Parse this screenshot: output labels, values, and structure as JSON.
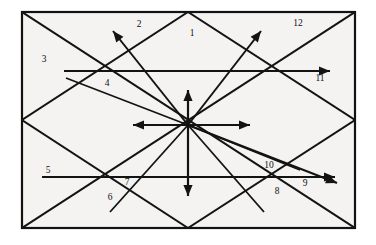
{
  "figure": {
    "kind": "geometric-line-diagram",
    "canvas": {
      "width": 376,
      "height": 245
    },
    "colors": {
      "ink": "#131313",
      "paper": "#f4f3f1",
      "page": "#ffffff"
    },
    "frame": {
      "name": "outer-rectangle",
      "x": 22,
      "y": 12,
      "width": 333,
      "height": 216
    },
    "center": {
      "x": 188,
      "y": 125
    },
    "labels": [
      {
        "id": "1",
        "text": "1",
        "x": 192,
        "y": 36
      },
      {
        "id": "2",
        "text": "2",
        "x": 139,
        "y": 27
      },
      {
        "id": "3",
        "text": "3",
        "x": 44,
        "y": 62
      },
      {
        "id": "4",
        "text": "4",
        "x": 107,
        "y": 86
      },
      {
        "id": "5",
        "text": "5",
        "x": 48,
        "y": 173
      },
      {
        "id": "6",
        "text": "6",
        "x": 110,
        "y": 200
      },
      {
        "id": "7",
        "text": "7",
        "x": 127,
        "y": 185
      },
      {
        "id": "8",
        "text": "8",
        "x": 277,
        "y": 194
      },
      {
        "id": "9",
        "text": "9",
        "x": 305,
        "y": 186
      },
      {
        "id": "10",
        "text": "10",
        "x": 269,
        "y": 168
      },
      {
        "id": "11",
        "text": "11",
        "x": 320,
        "y": 81
      },
      {
        "id": "12",
        "text": "12",
        "x": 298,
        "y": 26
      }
    ],
    "segments": [
      {
        "name": "diagonal-topleft-to-bottomright",
        "x1": 22,
        "y1": 12,
        "x2": 355,
        "y2": 228
      },
      {
        "name": "diagonal-bottomleft-to-topright",
        "x1": 22,
        "y1": 228,
        "x2": 355,
        "y2": 12
      },
      {
        "name": "rhombus-upper-left-edge",
        "x1": 22,
        "y1": 120,
        "x2": 188,
        "y2": 12
      },
      {
        "name": "rhombus-upper-right-edge",
        "x1": 188,
        "y1": 12,
        "x2": 355,
        "y2": 120
      },
      {
        "name": "rhombus-lower-right-edge",
        "x1": 355,
        "y1": 120,
        "x2": 188,
        "y2": 228
      },
      {
        "name": "rhombus-lower-left-edge",
        "x1": 188,
        "y1": 228,
        "x2": 22,
        "y2": 120
      }
    ],
    "arrows": [
      {
        "name": "ray-up",
        "x1": 188,
        "y1": 125,
        "x2": 188,
        "y2": 90,
        "head": true
      },
      {
        "name": "ray-down",
        "x1": 188,
        "y1": 125,
        "x2": 188,
        "y2": 196,
        "head": true
      },
      {
        "name": "ray-left",
        "x1": 188,
        "y1": 125,
        "x2": 133,
        "y2": 125,
        "head": true
      },
      {
        "name": "ray-right",
        "x1": 188,
        "y1": 125,
        "x2": 250,
        "y2": 125,
        "head": true
      },
      {
        "name": "ray-upper-left-diagonal",
        "x1": 188,
        "y1": 125,
        "x2": 113,
        "y2": 31,
        "head": true
      },
      {
        "name": "ray-upper-right-diagonal",
        "x1": 188,
        "y1": 125,
        "x2": 261,
        "y2": 31,
        "head": true
      },
      {
        "name": "horizontal-line-upper",
        "x1": 64,
        "y1": 71,
        "x2": 330,
        "y2": 71,
        "head": true
      },
      {
        "name": "horizontal-line-lower",
        "x1": 42,
        "y1": 177,
        "x2": 335,
        "y2": 177,
        "head": true
      },
      {
        "name": "ray-to-label-nine",
        "x1": 188,
        "y1": 125,
        "x2": 337,
        "y2": 183,
        "head": true
      }
    ],
    "plain_rays": [
      {
        "name": "ray-to-label-six",
        "x1": 188,
        "y1": 125,
        "x2": 110,
        "y2": 212
      },
      {
        "name": "ray-to-label-eight",
        "x1": 188,
        "y1": 125,
        "x2": 264,
        "y2": 212
      },
      {
        "name": "ray-to-label-four",
        "x1": 188,
        "y1": 125,
        "x2": 66,
        "y2": 78
      },
      {
        "name": "ray-to-label-ten",
        "x1": 188,
        "y1": 125,
        "x2": 300,
        "y2": 170
      }
    ]
  }
}
